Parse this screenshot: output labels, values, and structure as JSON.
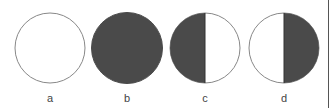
{
  "colors": {
    "dark_fill": "#4a4a4a",
    "light_fill": "#ffffff",
    "outline": "#888888",
    "border": "#555555"
  },
  "panels": [
    {
      "label": "a",
      "state": "all-light",
      "left_fill": "light",
      "right_fill": "light"
    },
    {
      "label": "b",
      "state": "all-dark",
      "left_fill": "dark",
      "right_fill": "dark"
    },
    {
      "label": "c",
      "state": "left-half-dark",
      "left_fill": "dark",
      "right_fill": "light"
    },
    {
      "label": "d",
      "state": "right-half-dark",
      "left_fill": "light",
      "right_fill": "dark"
    }
  ]
}
